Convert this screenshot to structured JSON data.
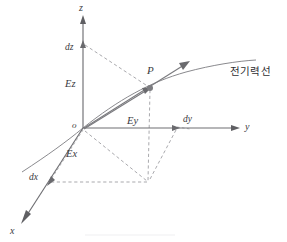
{
  "figure": {
    "title": "",
    "background_color": "#ffffff",
    "line_color": "#6f6f73",
    "dash_color": "#9a9a9e",
    "text_color": "#3a3a3e"
  },
  "axes": [
    {
      "id": "z",
      "label": "z",
      "direction": "up",
      "tip": {
        "x": 83,
        "y": 16
      },
      "origin": {
        "x": 83,
        "y": 128
      }
    },
    {
      "id": "y",
      "label": "y",
      "direction": "right",
      "tip": {
        "x": 233,
        "y": 128
      },
      "origin": {
        "x": 83,
        "y": 128
      }
    },
    {
      "id": "x",
      "label": "x",
      "direction": "down-left",
      "tip": {
        "x": 22,
        "y": 222
      },
      "origin": {
        "x": 83,
        "y": 128
      }
    }
  ],
  "components": [
    {
      "id": "Ez",
      "label": "Ez",
      "axis": "z",
      "position": {
        "x": 70,
        "y": 82
      }
    },
    {
      "id": "Ey",
      "label": "Ey",
      "axis": "y",
      "position": {
        "x": 131,
        "y": 120
      }
    },
    {
      "id": "Ex",
      "label": "Ex",
      "axis": "x",
      "position": {
        "x": 70,
        "y": 154
      }
    }
  ],
  "differentials": [
    {
      "id": "dz",
      "label": "dz",
      "axis": "z",
      "position": {
        "x": 70,
        "y": 48
      },
      "tick": {
        "x": 83,
        "y": 43
      }
    },
    {
      "id": "dy",
      "label": "dy",
      "axis": "y",
      "position": {
        "x": 180,
        "y": 119
      },
      "tick": {
        "x": 176,
        "y": 128
      }
    },
    {
      "id": "dx",
      "label": "dx",
      "axis": "x",
      "position": {
        "x": 30,
        "y": 176
      },
      "tick": {
        "x": 50,
        "y": 182
      }
    }
  ],
  "point": {
    "label": "P",
    "label_position": {
      "x": 148,
      "y": 72
    },
    "dot": {
      "x": 150,
      "y": 88
    },
    "vector_tip": {
      "x": 188,
      "y": 62
    }
  },
  "curve": {
    "label": "전기력선",
    "label_meaning": "electric field line",
    "label_position": {
      "x": 232,
      "y": 66
    },
    "start": {
      "x": 22,
      "y": 172
    },
    "end": {
      "x": 256,
      "y": 60
    }
  },
  "projection_box": {
    "corner": {
      "x": 148,
      "y": 182
    },
    "dy_corner": {
      "x": 176,
      "y": 128
    },
    "dx_corner": {
      "x": 50,
      "y": 182
    }
  },
  "origin": {
    "label": "o",
    "position": {
      "x": 73,
      "y": 121
    }
  }
}
